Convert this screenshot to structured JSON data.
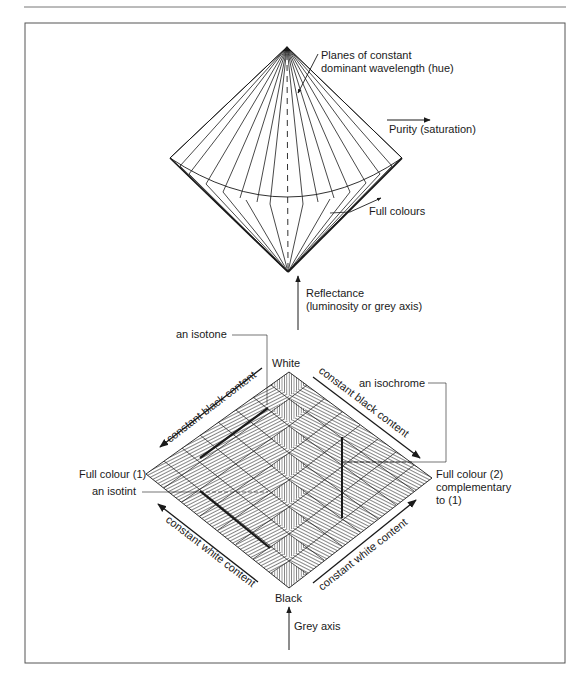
{
  "figure": {
    "top_diagram": {
      "hue_planes_label_line1": "Planes of constant",
      "hue_planes_label_line2": "dominant wavelength (hue)",
      "purity_label": "Purity (saturation)",
      "full_colours_label": "Full colours",
      "reflectance_label_line1": "Reflectance",
      "reflectance_label_line2": "(luminosity or grey axis)"
    },
    "bottom_diagram": {
      "isotone_label": "an isotone",
      "white_label": "White",
      "black_label": "Black",
      "isochrome_label": "an isochrome",
      "full_colour_1_label": "Full colour (1)",
      "isotint_label": "an isotint",
      "full_colour_2_line1": "Full colour (2)",
      "full_colour_2_line2": "complementary",
      "full_colour_2_line3": "to (1)",
      "upper_left_arrow_label": "constant black content",
      "upper_right_arrow_label": "constant black content",
      "lower_left_arrow_label": "constant white content",
      "lower_right_arrow_label": "constant white content",
      "grey_axis_label": "Grey axis"
    },
    "colors": {
      "ink": "#1a1a1a",
      "frame": "#555555",
      "background": "#ffffff"
    }
  }
}
